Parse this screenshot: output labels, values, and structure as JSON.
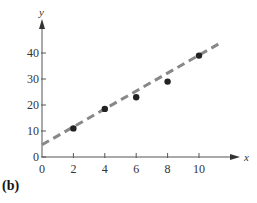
{
  "panel_label": "(b)",
  "chart_data": {
    "type": "scatter",
    "title": "",
    "xlabel": "x",
    "ylabel": "y",
    "xlim": [
      0,
      12
    ],
    "ylim": [
      0,
      45
    ],
    "x_ticks": [
      0,
      2,
      4,
      6,
      8,
      10
    ],
    "y_ticks": [
      0,
      10,
      20,
      30,
      40
    ],
    "grid": false,
    "legend": null,
    "series": [
      {
        "name": "data points",
        "type": "scatter",
        "color": "#222222",
        "x": [
          2,
          4,
          6,
          8,
          10
        ],
        "y": [
          11,
          18.5,
          23,
          29,
          39
        ]
      },
      {
        "name": "fitted line",
        "type": "line",
        "style": "dashed",
        "color": "#888888",
        "x": [
          0,
          11.4
        ],
        "y": [
          4.7,
          44
        ]
      }
    ]
  }
}
